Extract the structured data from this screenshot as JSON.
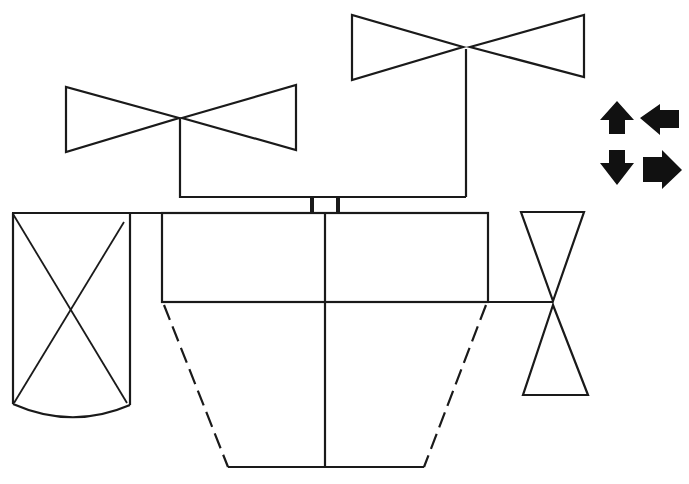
{
  "diagram": {
    "type": "schematic-line-drawing",
    "background": "#ffffff",
    "stroke_color": "#1a1a1a",
    "components": [
      {
        "name": "upper-left-valve",
        "kind": "bowtie-valve-horizontal"
      },
      {
        "name": "upper-right-valve",
        "kind": "bowtie-valve-horizontal"
      },
      {
        "name": "coupling",
        "kind": "connector-block"
      },
      {
        "name": "main-body-box",
        "kind": "rectangle-split"
      },
      {
        "name": "side-cabinet",
        "kind": "box-with-x-and-arc-bottom"
      },
      {
        "name": "vertical-valve",
        "kind": "bowtie-valve-vertical"
      },
      {
        "name": "hopper",
        "kind": "trapezoid-dashed-sides"
      }
    ],
    "legend_arrows": [
      {
        "name": "arrow-up",
        "direction": "up"
      },
      {
        "name": "arrow-left",
        "direction": "left"
      },
      {
        "name": "arrow-down",
        "direction": "down"
      },
      {
        "name": "arrow-right",
        "direction": "right"
      }
    ]
  }
}
